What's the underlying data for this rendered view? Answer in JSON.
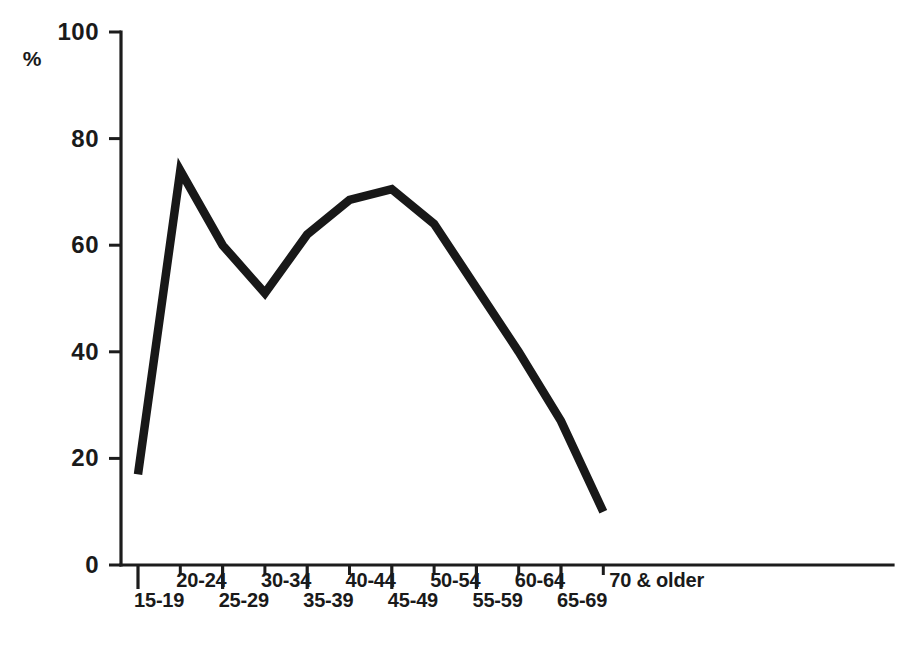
{
  "chart_data": {
    "type": "line",
    "title": "",
    "subtitle": "",
    "xlabel": "",
    "ylabel": "%",
    "ylim": [
      0,
      100
    ],
    "grid": false,
    "legend": null,
    "y_ticks": [
      0,
      20,
      40,
      60,
      80,
      100
    ],
    "y_tick_labels": [
      "0",
      "20",
      "40",
      "60",
      "80",
      "100"
    ],
    "categories": [
      "15-19",
      "20-24",
      "25-29",
      "30-34",
      "35-39",
      "40-44",
      "45-49",
      "50-54",
      "55-59",
      "60-64",
      "65-69",
      "70 & older"
    ],
    "values": [
      17,
      74,
      60,
      51,
      62,
      68.5,
      70.5,
      64,
      52,
      40,
      27,
      10
    ],
    "series": [
      {
        "name": "",
        "values": [
          17,
          74,
          60,
          51,
          62,
          68.5,
          70.5,
          64,
          52,
          40,
          27,
          10
        ],
        "color": "#181818"
      }
    ],
    "annotations": []
  },
  "axes": {
    "y_unit_symbol": "%",
    "x_label_stagger": "alternating-two-rows"
  },
  "colors": {
    "line": "#181818",
    "axis": "#1c1c1c",
    "text": "#1a1a1a",
    "background": "#ffffff"
  }
}
